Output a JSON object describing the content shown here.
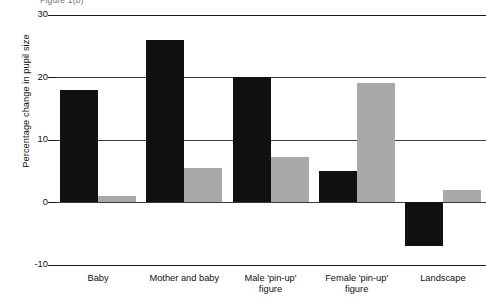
{
  "caption_top": "Figure 1(b)",
  "chart_data": {
    "type": "bar",
    "title": "",
    "xlabel": "",
    "ylabel": "Percentage change in pupil size",
    "categories": [
      "Baby",
      "Mother and baby",
      "Male 'pin-up'\nfigure",
      "Female 'pin-up'\nfigure",
      "Landscape"
    ],
    "series": [
      {
        "name": "Series 1",
        "color": "#111111",
        "values": [
          18,
          26,
          20,
          5,
          -7
        ]
      },
      {
        "name": "Series 2",
        "color": "#a9a9a9",
        "values": [
          1,
          5.4,
          7.2,
          19,
          2
        ]
      }
    ],
    "ylim": [
      -10,
      30
    ],
    "yticks": [
      30,
      20,
      10,
      0,
      -10
    ],
    "ytick_labels": [
      "30",
      "20",
      "10",
      "0",
      "-10"
    ],
    "grid": true,
    "legend": "none"
  }
}
